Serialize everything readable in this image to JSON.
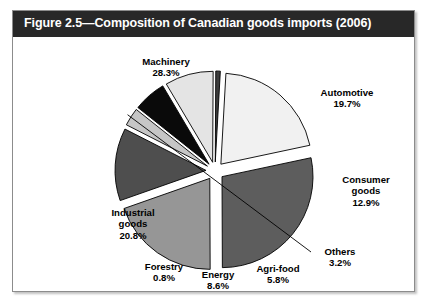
{
  "figure": {
    "title": "Figure 2.5—Composition of Canadian goods imports (2006)",
    "title_bar_color": "#282828",
    "frame_border_color": "#8c8c8c",
    "background_color": "#ffffff"
  },
  "chart_data": {
    "type": "pie",
    "title": "Figure 2.5—Composition of Canadian goods imports (2006)",
    "xlabel": "",
    "ylabel": "",
    "units": "percent",
    "legend_position": "none (labels placed around slices)",
    "grid": false,
    "categories": [
      "Machinery",
      "Automotive",
      "Consumer goods",
      "Others",
      "Agri-food",
      "Energy",
      "Forestry",
      "Industrial goods"
    ],
    "values": [
      28.3,
      19.7,
      12.9,
      3.2,
      5.8,
      8.6,
      0.8,
      20.8
    ],
    "slices": [
      {
        "label": "Machinery",
        "value": 28.3,
        "value_text": "28.3%",
        "color": "#5d5d5d",
        "label_lines": [
          "Machinery",
          "28.3%"
        ],
        "label_x": 107,
        "label_y": 45,
        "label_width": 92,
        "explode": 9,
        "leader": false
      },
      {
        "label": "Automotive",
        "value": 19.7,
        "value_text": "19.7%",
        "color": "#969696",
        "label_lines": [
          "Automotive",
          "19.7%"
        ],
        "label_x": 286,
        "label_y": 76,
        "label_width": 96,
        "explode": 9,
        "leader": false
      },
      {
        "label": "Consumer goods",
        "value": 12.9,
        "value_text": "12.9%",
        "color": "#4e4e4e",
        "label_lines": [
          "Consumer",
          "goods",
          "12.9%"
        ],
        "label_x": 308,
        "label_y": 163,
        "label_width": 90,
        "explode": 9,
        "leader": false
      },
      {
        "label": "Others",
        "value": 3.2,
        "value_text": "3.2%",
        "color": "#c6c6c6",
        "label_lines": [
          "Others",
          "3.2%"
        ],
        "label_x": 296,
        "label_y": 235,
        "label_width": 62,
        "explode": 9,
        "leader": true
      },
      {
        "label": "Agri-food",
        "value": 5.8,
        "value_text": "5.8%",
        "color": "#0a0a0a",
        "label_lines": [
          "Agri-food",
          "5.8%"
        ],
        "label_x": 228,
        "label_y": 252,
        "label_width": 74,
        "explode": 9,
        "leader": false
      },
      {
        "label": "Energy",
        "value": 8.6,
        "value_text": "8.6%",
        "color": "#e4e4e4",
        "label_lines": [
          "Energy",
          "8.6%"
        ],
        "label_x": 174,
        "label_y": 258,
        "label_width": 62,
        "explode": 9,
        "leader": false
      },
      {
        "label": "Forestry",
        "value": 0.8,
        "value_text": "0.8%",
        "color": "#3c3c3c",
        "label_lines": [
          "Forestry",
          "0.8%"
        ],
        "label_x": 119,
        "label_y": 250,
        "label_width": 64,
        "explode": 9,
        "leader": false
      },
      {
        "label": "Industrial goods",
        "value": 20.8,
        "value_text": "20.8%",
        "color": "#f1f1f1",
        "label_lines": [
          "Industrial",
          "goods",
          "20.8%"
        ],
        "label_x": 78,
        "label_y": 196,
        "label_width": 84,
        "explode": 9,
        "leader": false
      }
    ],
    "geometry": {
      "center_x": 202,
      "center_y": 134,
      "radius": 91,
      "start_angle_deg": -12
    }
  }
}
